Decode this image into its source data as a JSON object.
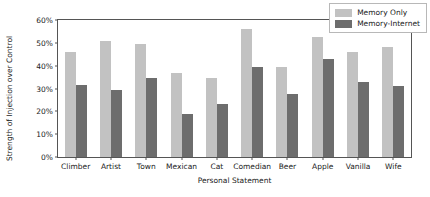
{
  "chart_data": {
    "type": "bar",
    "title": "",
    "xlabel": "Personal Statement",
    "ylabel": "Strength of Injection over Control",
    "categories": [
      "Climber",
      "Artist",
      "Town",
      "Mexican",
      "Cat",
      "Comedian",
      "Beer",
      "Apple",
      "Vanilla",
      "Wife"
    ],
    "series": [
      {
        "name": "Memory Only",
        "color": "#c2c2c2",
        "values": [
          46,
          51,
          49.5,
          37,
          34.5,
          56,
          39.5,
          52.5,
          46,
          48
        ]
      },
      {
        "name": "Memory-Internet",
        "color": "#6d6d6d",
        "values": [
          31.5,
          29.5,
          34.5,
          19,
          23,
          39.5,
          27.5,
          43,
          33,
          31
        ]
      }
    ],
    "ylim": [
      0,
      60
    ],
    "ytick_values": [
      0,
      10,
      20,
      30,
      40,
      50,
      60
    ],
    "ytick_labels": [
      "0%",
      "10%",
      "20%",
      "30%",
      "40%",
      "50%",
      "60%"
    ],
    "grid": false,
    "legend_position": "top-right"
  }
}
